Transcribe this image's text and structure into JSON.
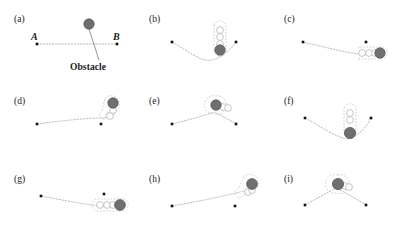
{
  "figure": {
    "title_text": "",
    "panel_count": 9,
    "colors": {
      "obstacle_fill": "#6f6f6f",
      "obstacle_stroke": "#5a5a5a",
      "robot_fill": "#ffffff",
      "robot_stroke": "#b9b9b9",
      "path_line": "#b5b5b5",
      "endpoint_dot": "#111111",
      "label_text": "#1a1a1a",
      "leader_line": "#7a7a7a",
      "background": "#ffffff"
    },
    "annotations": {
      "point_a_label": "A",
      "point_b_label": "B",
      "obstacle_label": "Obstacle"
    },
    "panels": [
      {
        "letter": "(a)",
        "lx": 14,
        "ly": 14,
        "start": [
          37,
          44
        ],
        "goal": [
          117,
          44
        ],
        "obstacle": [
          89,
          24
        ],
        "obstacle_r": 5.2,
        "path": "M37,44 L117,44",
        "path_style": "dotted",
        "robots": [],
        "hull": "",
        "a_label": [
          31,
          31
        ],
        "b_label": [
          113,
          31
        ],
        "leader": "M89,29 L99,60",
        "word": [
          70,
          62
        ]
      },
      {
        "letter": "(b)",
        "lx": 149,
        "ly": 14,
        "start": [
          172,
          42
        ],
        "goal": [
          236,
          42
        ],
        "obstacle": [
          220,
          50
        ],
        "obstacle_r": 5.2,
        "path": "M172,42 C190,52 200,62 212,60 C222,58 230,50 236,42",
        "path_style": "dotted",
        "robots": [
          [
            220,
            30
          ],
          [
            220,
            37
          ],
          [
            220,
            44
          ]
        ],
        "hull": "M214,25 a6.4,6.4 0 0 1 12,0 L226,52 a6.4,6.4 0 0 1 -12,0 Z",
        "a_label": null,
        "b_label": null,
        "leader": "",
        "word": null
      },
      {
        "letter": "(c)",
        "lx": 284,
        "ly": 14,
        "start": [
          303,
          42
        ],
        "goal": [
          366,
          42
        ],
        "obstacle": [
          380,
          53
        ],
        "obstacle_r": 5.2,
        "path": "M303,42 C325,47 350,54 368,55",
        "path_style": "dotted",
        "robots": [
          [
            362,
            53
          ],
          [
            369,
            53
          ],
          [
            375,
            53
          ]
        ],
        "hull": "M358,47 a6.4,6.4 0 0 1 0,12 L383,59 a6.4,6.4 0 0 0 0,-12 Z",
        "a_label": null,
        "b_label": null,
        "leader": "",
        "word": null
      },
      {
        "letter": "(d)",
        "lx": 14,
        "ly": 96,
        "start": [
          37,
          124
        ],
        "goal": [
          101,
          124
        ],
        "obstacle": [
          113,
          103
        ],
        "obstacle_r": 5.2,
        "path": "M37,124 C60,121 85,118 104,118 C114,117 118,112 114,109",
        "path_style": "dotted",
        "robots": [
          [
            110,
            116
          ],
          [
            113,
            110
          ]
        ],
        "hull": "M105,98 a8.6,8.6 0 1 1 2,14 L104,120 a5,5 0 0 1 -2,-9 Z",
        "a_label": null,
        "b_label": null,
        "leader": "",
        "word": null
      },
      {
        "letter": "(e)",
        "lx": 149,
        "ly": 96,
        "start": [
          172,
          124
        ],
        "goal": [
          236,
          124
        ],
        "obstacle": [
          216,
          105
        ],
        "obstacle_r": 5.2,
        "path": "M172,124 C188,120 204,116 214,112 C222,116 230,120 236,124",
        "path_style": "dotted",
        "robots": [
          [
            223,
            107
          ],
          [
            228,
            108
          ]
        ],
        "hull": "M216,96 a9.2,9.2 0 1 1 -1,18 a9.2,9.2 0 1 1 1,-18 Z",
        "a_label": null,
        "b_label": null,
        "leader": "",
        "word": null
      },
      {
        "letter": "(f)",
        "lx": 284,
        "ly": 96,
        "start": [
          305,
          118
        ],
        "goal": [
          371,
          118
        ],
        "obstacle": [
          350,
          133
        ],
        "obstacle_r": 5.6,
        "path": "M305,118 C320,126 334,136 346,139 C358,137 366,128 371,118",
        "path_style": "dotted",
        "robots": [
          [
            350,
            113
          ],
          [
            350,
            120
          ]
        ],
        "hull": "M344,108 a6.4,6.4 0 0 1 12,0 L356,133 a6.4,6.4 0 0 1 -12,0 Z",
        "a_label": null,
        "b_label": null,
        "leader": "",
        "word": null
      },
      {
        "letter": "(g)",
        "lx": 14,
        "ly": 174,
        "start": [
          41,
          196
        ],
        "goal": [
          104,
          194
        ],
        "obstacle": [
          120,
          205
        ],
        "obstacle_r": 5.4,
        "path": "M41,196 C62,200 88,205 108,207",
        "path_style": "dotted",
        "robots": [
          [
            100,
            205
          ],
          [
            107,
            205
          ],
          [
            113,
            205
          ]
        ],
        "hull": "M96,199 a6.4,6.4 0 0 0 0,12 L124,211 a6.4,6.4 0 0 0 0,-12 Z",
        "a_label": null,
        "b_label": null,
        "leader": "",
        "word": null
      },
      {
        "letter": "(h)",
        "lx": 149,
        "ly": 174,
        "start": [
          172,
          206
        ],
        "goal": [
          235,
          206
        ],
        "obstacle": [
          252,
          184
        ],
        "obstacle_r": 5.4,
        "path": "M172,206 C196,202 224,196 240,192 C248,190 252,188 251,186",
        "path_style": "dotted",
        "robots": [
          [
            248,
            192
          ],
          [
            252,
            190
          ]
        ],
        "hull": "M244,176 a9,9 0 1 1 3,16 L241,198 a5,5 0 0 1 -2,-10 Z",
        "a_label": null,
        "b_label": null,
        "leader": "",
        "word": null
      },
      {
        "letter": "(i)",
        "lx": 284,
        "ly": 174,
        "start": [
          305,
          205
        ],
        "goal": [
          366,
          205
        ],
        "obstacle": [
          338,
          184
        ],
        "obstacle_r": 5.6,
        "path": "M305,205 C316,199 328,192 336,188 C346,193 357,199 366,205",
        "path_style": "dotted",
        "robots": [
          [
            345,
            186
          ],
          [
            349,
            187
          ]
        ],
        "hull": "M338,175 a9.4,9.4 0 1 1 -1,18 a9.4,9.4 0 1 1 1,-18 Z",
        "a_label": null,
        "b_label": null,
        "leader": "",
        "word": null
      }
    ]
  }
}
